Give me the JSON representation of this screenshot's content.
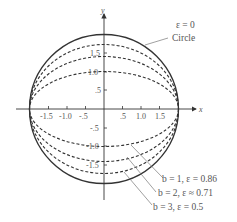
{
  "figure": {
    "axes": {
      "x_label": "x",
      "y_label": "y",
      "x_ticks": [
        "-1.5",
        "-1.0",
        "-.5",
        ".5",
        "1.0",
        "1.5"
      ],
      "y_ticks": [
        "1.5",
        "1.0",
        ".5",
        "-.5",
        "-1.0",
        "-1.5"
      ]
    },
    "curves": [
      {
        "name": "circle",
        "label_line1": "ε = 0",
        "label_line2": "Circle",
        "style": "solid",
        "a": 2,
        "semi_minor": 2
      },
      {
        "name": "ellipse-b1",
        "label": "b = 1,  ε = 0.86",
        "style": "dashed",
        "a": 2,
        "semi_minor": 1.0
      },
      {
        "name": "ellipse-b2",
        "label": "b = 2,  ε ≈ 0.71",
        "style": "dashed",
        "a": 2,
        "semi_minor": 1.41
      },
      {
        "name": "ellipse-b3",
        "label": "b = 3,  ε = 0.5",
        "style": "dashed",
        "a": 2,
        "semi_minor": 1.73
      }
    ],
    "colors": {
      "stroke": "#333333",
      "text": "#555555",
      "leader": "#777777"
    }
  }
}
